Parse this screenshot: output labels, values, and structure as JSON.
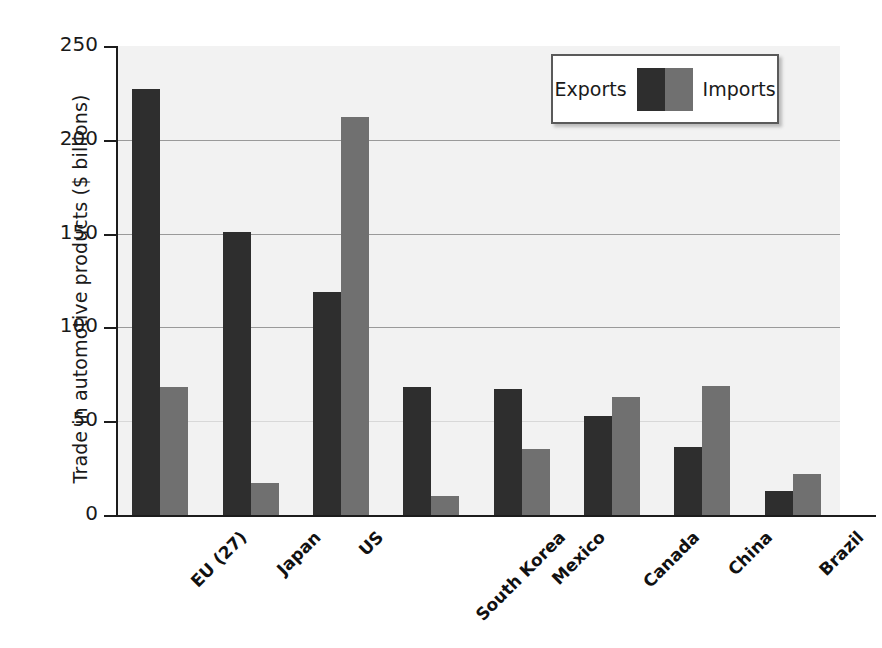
{
  "chart_data": {
    "type": "bar",
    "title": "",
    "xlabel": "",
    "ylabel": "Trade in automotive products ($ billions)",
    "ylim": [
      0,
      250
    ],
    "yticks": [
      "0",
      "50",
      "100",
      "150",
      "200",
      "250"
    ],
    "grid": true,
    "legend_position": "top-right",
    "categories": [
      "EU (27)",
      "Japan",
      "US",
      "South Korea",
      "Mexico",
      "Canada",
      "China",
      "Brazil"
    ],
    "series": [
      {
        "name": "Exports",
        "color": "#2e2e2e",
        "values": [
          227,
          151,
          119,
          68,
          67,
          53,
          36,
          13
        ]
      },
      {
        "name": "Imports",
        "color": "#707070",
        "values": [
          68,
          17,
          212,
          10,
          35,
          63,
          69,
          22
        ]
      }
    ]
  },
  "legend": {
    "exports_label": "Exports",
    "imports_label": "Imports"
  }
}
